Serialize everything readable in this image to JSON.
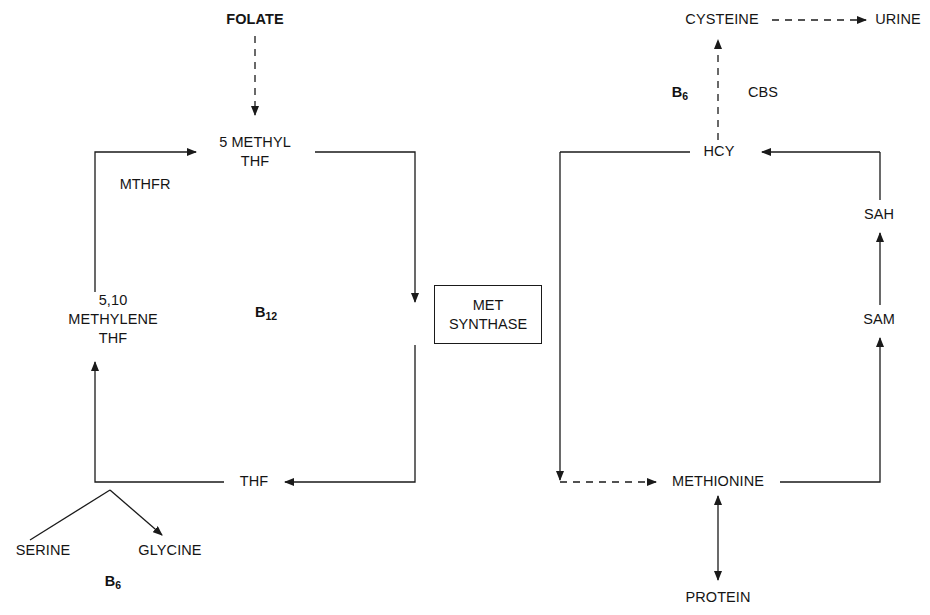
{
  "diagram": {
    "colors": {
      "line": "#1a1a1a",
      "text": "#151515",
      "background": "#ffffff"
    },
    "nodes": {
      "folate": "FOLATE",
      "five_methyl_thf": "5 METHYL\nTHF",
      "methylene_thf": "5,10\nMETHYLENE\nTHF",
      "thf": "THF",
      "serine": "SERINE",
      "glycine": "GLYCINE",
      "cysteine": "CYSTEINE",
      "urine": "URINE",
      "hcy": "HCY",
      "sah": "SAH",
      "sam": "SAM",
      "methionine": "METHIONINE",
      "protein": "PROTEIN"
    },
    "enzymes": {
      "mthfr": "MTHFR",
      "cbs": "CBS",
      "met_synthase": "MET\nSYNTHASE"
    },
    "cofactors": {
      "b12": "B",
      "b12_sub": "12",
      "b6_serine": "B",
      "b6_serine_sub": "6",
      "b6_cbs": "B",
      "b6_cbs_sub": "6"
    }
  }
}
